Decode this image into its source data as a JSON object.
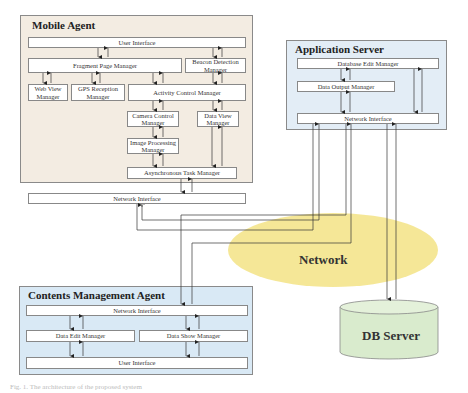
{
  "mobile_agent": {
    "title": "Mobile Agent",
    "color": "#f3ece2",
    "user_interface": "User Interface",
    "fragment_page_manager": "Fragment Page  Manager",
    "beacon_detection_manager": "Beacon Detection Manager",
    "web_view_manager": "Web View Manager",
    "gps_reception_manager": "GPS Reception Manager",
    "activity_control_manager": "Activity Control Manager",
    "camera_control_manager": "Camera Control Manager",
    "data_view_manager": "Data View Manager",
    "image_processing_manager": "Image Processing Manager",
    "asynchronous_task_manager": "Asynchronous Task Manager",
    "network_interface": "Network Interface"
  },
  "application_server": {
    "title": "Application Server",
    "color": "#e3edf6",
    "database_edit_manager": "Database Edit Manager",
    "data_output_manager": "Data Output Manager",
    "network_interface": "Network Interface"
  },
  "network": {
    "label": "Network",
    "color": "#f4e48c"
  },
  "contents_management_agent": {
    "title": "Contents Management Agent",
    "color": "#d9e9f5",
    "network_interface": "Network Interface",
    "data_edit_manager": "Data Edit Manager",
    "data_show_manager": "Data Show Manager",
    "user_interface": "User Interface"
  },
  "db_server": {
    "label": "DB Server",
    "color": "#d9ebcd"
  },
  "caption": "Fig. 1.  The architecture of the proposed system"
}
